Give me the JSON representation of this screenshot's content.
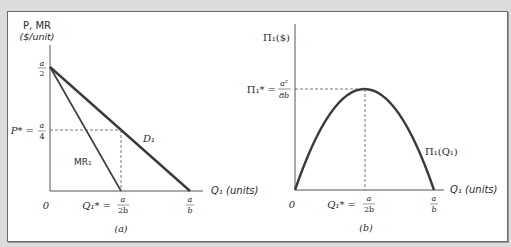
{
  "panel_a": {
    "y_axis_label_line1": "P, MR",
    "y_axis_label_line2": "($/unit)",
    "y_tick_top_num": "a",
    "y_tick_top_den": "2",
    "y_tick_pstar_prefix": "P* =",
    "y_tick_pstar_num": "a",
    "y_tick_pstar_den": "4",
    "origin_label": "0",
    "x_tick_qstar_prefix": "Q₁* =",
    "x_tick_qstar_num": "a",
    "x_tick_qstar_den": "2b",
    "x_tick_end_num": "a",
    "x_tick_end_den": "b",
    "x_axis_label": "Q₁ (units)",
    "demand_label": "D₁",
    "mr_label": "MR₁",
    "caption": "(a)"
  },
  "panel_b": {
    "y_axis_label": "Π₁($)",
    "y_tick_pistar_prefix": "Π₁* =",
    "y_tick_pistar_num": "a²",
    "y_tick_pistar_den": "8b",
    "origin_label": "0",
    "x_tick_qstar_prefix": "Q₁* =",
    "x_tick_qstar_num": "a",
    "x_tick_qstar_den": "2b",
    "x_tick_end_num": "a",
    "x_tick_end_den": "b",
    "x_axis_label": "Q₁ (units)",
    "curve_label": "Π₁(Q₁)",
    "caption": "(b)"
  },
  "colors": {
    "background": "#dcdcdc",
    "panel": "#ffffff",
    "line": "#3a3a3a"
  }
}
